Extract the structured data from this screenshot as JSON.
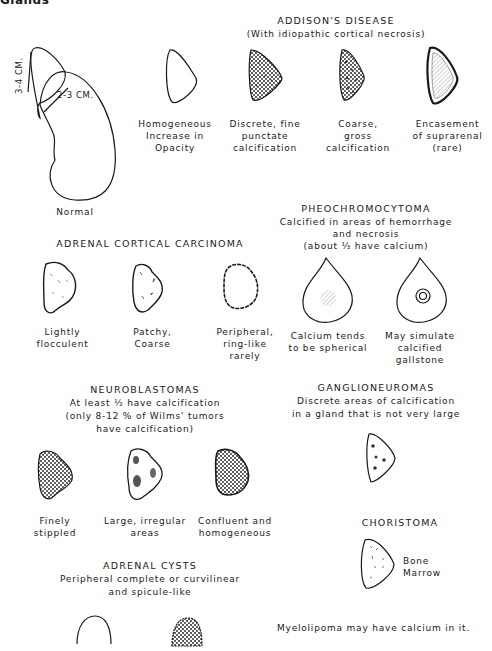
{
  "page": {
    "heading": "Glands"
  },
  "normal": {
    "label": "Normal",
    "dim_height": "3-4 CM.",
    "dim_width": "2-3 CM."
  },
  "addisons": {
    "title": "ADDISON'S DISEASE",
    "subtitle": "(With idiopathic cortical necrosis)",
    "items": [
      {
        "label": "Homogeneous\nIncrease in\nOpacity"
      },
      {
        "label": "Discrete, fine\npunctate\ncalcification"
      },
      {
        "label": "Coarse,\ngross\ncalcification"
      },
      {
        "label": "Encasement\nof suprarenal\n(rare)"
      }
    ]
  },
  "pheochromocytoma": {
    "title": "PHEOCHROMOCYTOMA",
    "subtitle_lines": [
      "Calcified in areas of hemorrhage",
      "and necrosis",
      "(about ⅓ have calcium)"
    ],
    "items": [
      {
        "label": "Calcium tends\nto be spherical"
      },
      {
        "label": "May simulate\ncalcified\ngallstone"
      }
    ]
  },
  "adrenal_cortical_carcinoma": {
    "title": "ADRENAL CORTICAL CARCINOMA",
    "items": [
      {
        "label": "Lightly\nflocculent"
      },
      {
        "label": "Patchy,\nCoarse"
      },
      {
        "label": "Peripheral,\nring-like\nrarely"
      }
    ]
  },
  "neuroblastomas": {
    "title": "NEUROBLASTOMAS",
    "subtitle_lines": [
      "At least ½ have calcification",
      "(only 8-12 % of Wilms' tumors",
      "have calcification)"
    ],
    "items": [
      {
        "label": "Finely\nstippled"
      },
      {
        "label": "Large, irregular\nareas"
      },
      {
        "label": "Confluent and\nhomogeneous"
      }
    ]
  },
  "ganglioneuromas": {
    "title": "GANGLIONEUROMAS",
    "subtitle_lines": [
      "Discrete areas of calcification",
      "in a gland that is not very large"
    ]
  },
  "choristoma": {
    "title": "CHORISTOMA",
    "annotation": "Bone\nMarrow"
  },
  "adrenal_cysts": {
    "title": "ADRENAL CYSTS",
    "subtitle_lines": [
      "Peripheral complete or curvilinear",
      "and spicule-like"
    ]
  },
  "footnote": "Myelolipoma may have calcium in it."
}
